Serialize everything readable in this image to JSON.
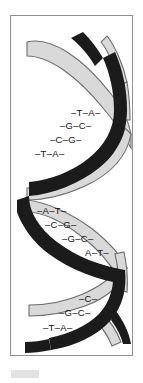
{
  "figure": {
    "name": "dna-double-helix",
    "frame": {
      "border_color": "#8f8f8f",
      "background": "#ffffff"
    },
    "strands": [
      {
        "id": "strand-light",
        "label": "light-ribbon",
        "color": "#d9d9d9",
        "outline": "#6e6e6e"
      },
      {
        "id": "strand-dark",
        "label": "dark-ribbon",
        "color": "#1b1b1b",
        "outline": "#000000"
      }
    ],
    "caption_block": {
      "color": "#e3e3e3"
    }
  },
  "base_pairs": {
    "groups": [
      {
        "id": "group-1",
        "rows": [
          {
            "text": "–T–A–",
            "x": 60,
            "y": 92
          },
          {
            "text": "–G–C–",
            "x": 49,
            "y": 105
          },
          {
            "text": "–C–G–",
            "x": 39,
            "y": 119
          },
          {
            "text": "–T–A–",
            "x": 24,
            "y": 133
          }
        ]
      },
      {
        "id": "group-2",
        "rows": [
          {
            "text": "–A–T–",
            "x": 26,
            "y": 190
          },
          {
            "text": "–C–G–",
            "x": 34,
            "y": 204
          },
          {
            "text": "–G–C–",
            "x": 51,
            "y": 218
          },
          {
            "text": "A–T–",
            "x": 74,
            "y": 232
          }
        ]
      },
      {
        "id": "group-3",
        "rows": [
          {
            "text": "–C–",
            "x": 68,
            "y": 278
          },
          {
            "text": "–G–C–",
            "x": 48,
            "y": 292
          },
          {
            "text": "–T–A–",
            "x": 32,
            "y": 307
          }
        ]
      }
    ]
  }
}
